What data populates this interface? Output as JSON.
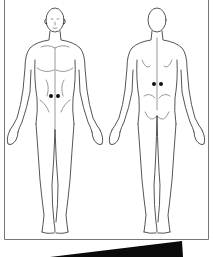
{
  "figure": {
    "type": "anatomical body chart",
    "views": [
      {
        "name": "front",
        "markers": [
          {
            "x": 51,
            "y": 96
          },
          {
            "x": 58,
            "y": 96
          }
        ]
      },
      {
        "name": "back",
        "markers": [
          {
            "x": 154,
            "y": 84
          },
          {
            "x": 161,
            "y": 84
          }
        ]
      }
    ],
    "marker_color": "#111111",
    "line_color": "#2a2a2a",
    "frame_color": "#777777"
  },
  "banner": {
    "text": "",
    "color": "#0a0a0a"
  }
}
